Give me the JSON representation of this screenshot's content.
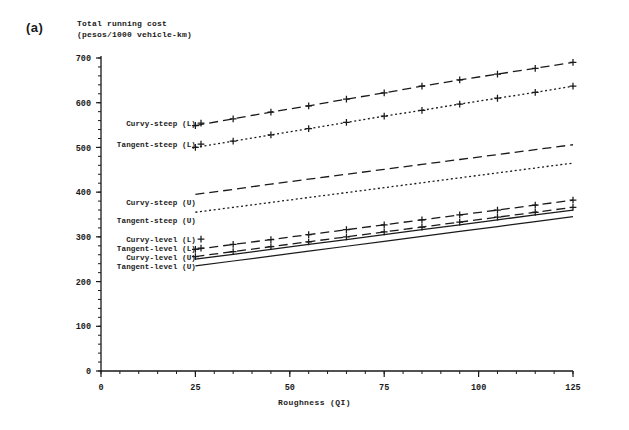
{
  "figure": {
    "panel_label": "(a)",
    "y_axis_title_line1": "Total running cost",
    "y_axis_title_line2": "(pesos/1000 vehicle-km)",
    "x_axis_title": "Roughness (QI)"
  },
  "chart_data": {
    "type": "line",
    "title": "Total running cost (pesos/1000 vehicle-km)",
    "xlabel": "Roughness (QI)",
    "ylabel": "Total running cost (pesos/1000 vehicle-km)",
    "xlim": [
      0,
      125
    ],
    "ylim": [
      0,
      700
    ],
    "x_ticks": [
      0,
      25,
      50,
      75,
      100,
      125
    ],
    "y_ticks": [
      0,
      100,
      200,
      300,
      400,
      500,
      600,
      700
    ],
    "x_minor_step": 5,
    "y_minor_step": 20,
    "grid": false,
    "legend_position": "inline-left-of-curves",
    "x": [
      25,
      35,
      45,
      55,
      65,
      75,
      85,
      95,
      105,
      115,
      125
    ],
    "series": [
      {
        "name": "Curvy-steep (L)",
        "label": "Curvy-steep (L)",
        "style": "dashed",
        "marker": "plus",
        "values": [
          549,
          564,
          579,
          593,
          608,
          622,
          637,
          651,
          664,
          677,
          690
        ]
      },
      {
        "name": "Tangent-steep (L)",
        "label": "Tangent-steep (L)",
        "style": "dotted",
        "marker": "plus",
        "values": [
          500,
          514,
          528,
          542,
          556,
          570,
          583,
          597,
          610,
          623,
          637
        ]
      },
      {
        "name": "Curvy-steep (U)",
        "label": "Curvy-steep (U)",
        "style": "dashed",
        "marker": "none",
        "values": [
          395,
          406,
          418,
          429,
          440,
          451,
          462,
          473,
          484,
          495,
          506
        ]
      },
      {
        "name": "Tangent-steep (U)",
        "label": "Tangent-steep (U)",
        "style": "dotted",
        "marker": "none",
        "values": [
          355,
          366,
          377,
          388,
          399,
          410,
          421,
          432,
          443,
          454,
          465
        ]
      },
      {
        "name": "Curvy-level (L)",
        "label": "Curvy-level (L)",
        "style": "dashed",
        "marker": "plus",
        "values": [
          272,
          283,
          294,
          305,
          316,
          327,
          338,
          349,
          360,
          371,
          382
        ]
      },
      {
        "name": "Tangent-level (L)",
        "label": "Tangent-level (L)",
        "style": "dashed",
        "marker": "plus",
        "values": [
          256,
          267,
          278,
          289,
          300,
          311,
          322,
          333,
          344,
          355,
          366
        ]
      },
      {
        "name": "Curvy-level (U)",
        "label": "Curvy-level (U)",
        "style": "solid",
        "marker": "none",
        "values": [
          250,
          261,
          272,
          283,
          294,
          305,
          316,
          327,
          338,
          349,
          360
        ]
      },
      {
        "name": "Tangent-level (U)",
        "label": "Tangent-level (U)",
        "style": "solid",
        "marker": "none",
        "values": [
          235,
          246,
          257,
          268,
          279,
          290,
          301,
          312,
          323,
          334,
          345
        ]
      }
    ],
    "legend_anchors": [
      {
        "series": "Curvy-steep (L)",
        "label_x": 196,
        "label_y": 123
      },
      {
        "series": "Tangent-steep (L)",
        "label_x": 196,
        "label_y": 144
      },
      {
        "series": "Curvy-steep (U)",
        "label_x": 196,
        "label_y": 202
      },
      {
        "series": "Tangent-steep (U)",
        "label_x": 196,
        "label_y": 220
      },
      {
        "series": "Curvy-level (L)",
        "label_x": 196,
        "label_y": 239
      },
      {
        "series": "Tangent-level (L)",
        "label_x": 196,
        "label_y": 248
      },
      {
        "series": "Curvy-level (U)",
        "label_x": 196,
        "label_y": 257
      },
      {
        "series": "Tangent-level (U)",
        "label_x": 196,
        "label_y": 266
      }
    ]
  }
}
